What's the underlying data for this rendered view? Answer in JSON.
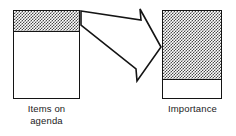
{
  "figure": {
    "type": "diagram",
    "background_color": "#ffffff",
    "line_color": "#141414",
    "shading_color": "#4a4a4a"
  },
  "bars": [
    {
      "id": "items-on-agenda",
      "label": "Items on\nagenda",
      "segments": [
        {
          "name": "shaded",
          "fill": "hatched",
          "proportion": 0.24
        },
        {
          "name": "empty",
          "fill": "white",
          "proportion": 0.76
        }
      ]
    },
    {
      "id": "importance",
      "label": "Importance",
      "segments": [
        {
          "name": "shaded",
          "fill": "hatched",
          "proportion": 0.78
        },
        {
          "name": "empty",
          "fill": "white",
          "proportion": 0.22
        }
      ]
    }
  ],
  "arrow": {
    "name": "block-arrow",
    "direction": "right-down",
    "style": "hollow-outline",
    "from": "items-on-agenda",
    "to": "importance"
  }
}
